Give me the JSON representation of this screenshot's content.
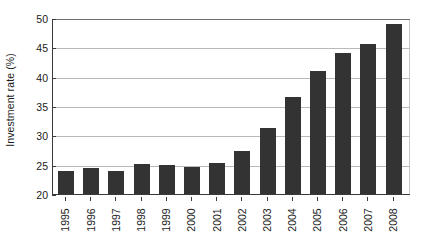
{
  "chart_data": {
    "type": "bar",
    "title": "",
    "xlabel": "",
    "ylabel": "Investment rate (%)",
    "categories": [
      "1995",
      "1996",
      "1997",
      "1998",
      "1999",
      "2000",
      "2001",
      "2002",
      "2003",
      "2004",
      "2005",
      "2006",
      "2007",
      "2008"
    ],
    "values": [
      24.0,
      24.5,
      23.9,
      25.1,
      25.0,
      24.6,
      25.3,
      27.3,
      31.2,
      36.5,
      40.9,
      44.0,
      45.5,
      49.0
    ],
    "ylim": [
      20,
      50
    ],
    "yticks": [
      20,
      25,
      30,
      35,
      40,
      45,
      50
    ],
    "ytick_labels": [
      "20",
      "25",
      "30",
      "35",
      "40",
      "45",
      "50"
    ],
    "grid": true,
    "legend": "none",
    "bar_color": "#333333",
    "gridline_color": "#b9b9b9",
    "axis_color": "#3a3a3a",
    "background_color": "#ffffff"
  }
}
